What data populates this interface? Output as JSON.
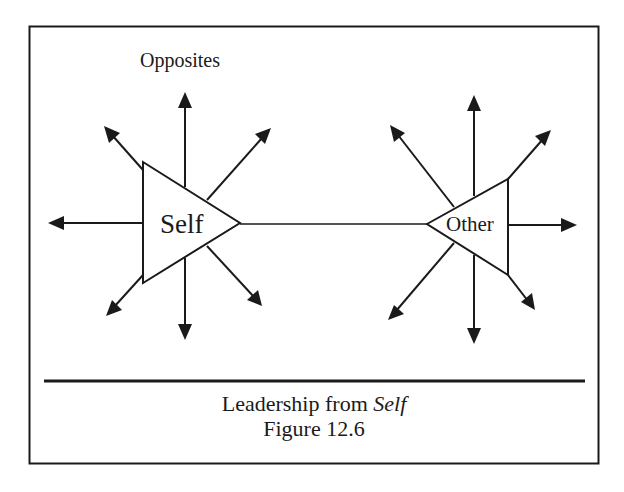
{
  "diagram": {
    "title_label": "Opposites",
    "nodes": {
      "self": {
        "label": "Self"
      },
      "other": {
        "label": "Other"
      }
    },
    "caption": {
      "line1_prefix": "Leadership from ",
      "line1_emphasis": "Self",
      "line2": "Figure 12.6"
    },
    "colors": {
      "stroke": "#1a1a1a",
      "background": "#ffffff"
    },
    "self_arrows": [
      "up",
      "up-left",
      "up-right",
      "left",
      "down-left",
      "down",
      "down-right"
    ],
    "other_arrows": [
      "up",
      "up-left",
      "up-right",
      "right",
      "down-left",
      "down",
      "down-right"
    ],
    "connector": "self-to-other line"
  }
}
